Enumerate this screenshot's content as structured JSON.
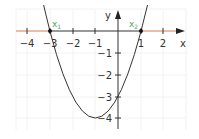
{
  "diagram": {
    "title": "",
    "function": "y = x^2 + 2x - 3",
    "axes": {
      "x_label": "x",
      "y_label": "y",
      "x_ticks": [
        "−4",
        "−3",
        "−2",
        "−1",
        "1",
        "2"
      ],
      "y_ticks": [
        "−1",
        "−2",
        "−3",
        "−4"
      ]
    },
    "roots": [
      {
        "label": "x",
        "subscript": "1",
        "x": -3,
        "y": 0
      },
      {
        "label": "x",
        "subscript": "2",
        "x": 1,
        "y": 0
      }
    ],
    "vertex": {
      "x": -1,
      "y": -4
    },
    "y_intercept": {
      "x": 0,
      "y": -3
    },
    "colors": {
      "curve": "#333333",
      "axis": "#333333",
      "highlight": "#e8a48a",
      "root_label": "#5aa06a",
      "grid": "#f0f0f0"
    }
  }
}
